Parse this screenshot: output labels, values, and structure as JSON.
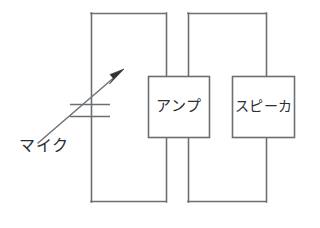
{
  "diagram": {
    "background_color": "#ffffff",
    "line_color": "#6b6f74",
    "text_color": "#2b2e33",
    "arrow_color": "#2f3236",
    "components": {
      "mic": {
        "label": "マイク",
        "symbol": "variable-capacitor-microphone",
        "label_x": 20,
        "label_y": 138
      },
      "amp": {
        "label": "アンプ",
        "x": 148,
        "y": 76,
        "width": 62,
        "height": 62
      },
      "speaker": {
        "label": "スピーカ",
        "x": 232,
        "y": 76,
        "width": 63,
        "height": 62
      }
    },
    "wiring": {
      "loop_left": {
        "left_x": 91,
        "right_x": 166,
        "top_y": 13,
        "bottom_y": 202
      },
      "loop_right": {
        "left_x": 188,
        "right_x": 266,
        "top_y": 13,
        "bottom_y": 202
      },
      "mic_plate_upper_y": 104,
      "mic_plate_lower_y": 116,
      "mic_plate_left_x": 70,
      "mic_plate_right_x": 110,
      "arrow_start": [
        38,
        143
      ],
      "arrow_end": [
        124,
        69
      ]
    }
  }
}
